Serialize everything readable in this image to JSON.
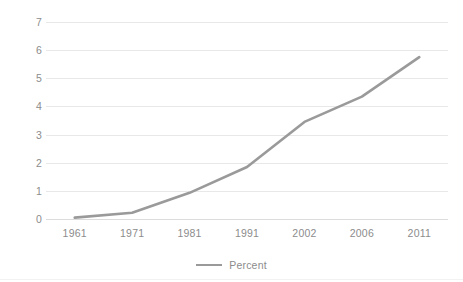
{
  "chart_data": {
    "type": "line",
    "title": "",
    "subtitle": "",
    "xlabel": "",
    "ylabel": "",
    "categories": [
      "1961",
      "1971",
      "1981",
      "1991",
      "2002",
      "2006",
      "2011"
    ],
    "series": [
      {
        "name": "Percent",
        "values": [
          0.05,
          0.22,
          0.93,
          1.85,
          3.45,
          4.35,
          5.75
        ],
        "color": "#9a9a9a"
      }
    ],
    "ylim": [
      0,
      7
    ],
    "yticks": [
      "0",
      "1",
      "2",
      "3",
      "4",
      "5",
      "6",
      "7"
    ],
    "ytick_values": [
      0,
      1,
      2,
      3,
      4,
      5,
      6,
      7
    ],
    "grid": true,
    "grid_color": "#e8e8e8",
    "legend": {
      "position": "bottom",
      "entries": [
        {
          "label": "Percent",
          "color": "#9a9a9a"
        }
      ]
    },
    "axis_label_color": "#8c8c8c",
    "background": "#ffffff"
  }
}
